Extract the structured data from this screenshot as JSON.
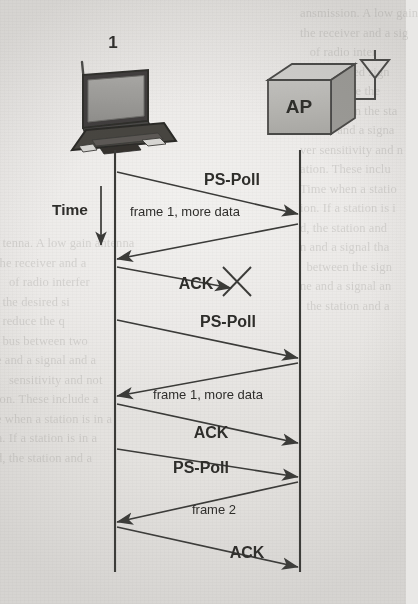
{
  "figure": {
    "background_color": "#e9e8e6",
    "ink_color": "#3a3a38",
    "fill_color": "#b9b8b5"
  },
  "nodes": {
    "station": {
      "label": "1",
      "icon": "laptop-icon",
      "timeline_x": 115,
      "timeline_top": 150,
      "timeline_bottom": 572
    },
    "access_point": {
      "label": "AP",
      "icon": "access-point-box-icon",
      "antenna_icon": "antenna-icon",
      "timeline_x": 300,
      "timeline_top": 150,
      "timeline_bottom": 572
    }
  },
  "time_axis": {
    "label": "Time",
    "arrow_icon": "arrow-down-icon",
    "x": 101,
    "y_start": 186,
    "y_end": 245
  },
  "failure_marker": {
    "icon": "cross-mark-icon",
    "meaning": "transmission lost",
    "x": 236,
    "y": 281,
    "size": 28
  },
  "chart_data": {
    "type": "sequence",
    "lifelines": [
      "1",
      "AP"
    ],
    "messages": [
      {
        "index": 1,
        "label": "PS-Poll",
        "from": "1",
        "to": "AP",
        "y_from": 172,
        "y_to": 214,
        "label_x": 232,
        "label_y": 185,
        "bold": true,
        "font_size": 16,
        "delivered": true
      },
      {
        "index": 2,
        "label": "frame 1, more data",
        "from": "AP",
        "to": "1",
        "y_from": 224,
        "y_to": 259,
        "label_x": 185,
        "label_y": 216,
        "bold": false,
        "font_size": 13,
        "delivered": true
      },
      {
        "index": 3,
        "label": "ACK",
        "from": "1",
        "to": "AP",
        "y_from": 267,
        "y_to": 300,
        "label_x": 196,
        "label_y": 289,
        "bold": true,
        "font_size": 16,
        "delivered": false
      },
      {
        "index": 4,
        "label": "PS-Poll",
        "from": "1",
        "to": "AP",
        "y_from": 320,
        "y_to": 358,
        "label_x": 228,
        "label_y": 327,
        "bold": true,
        "font_size": 16,
        "delivered": true
      },
      {
        "index": 5,
        "label": "frame 1, more data",
        "from": "AP",
        "to": "1",
        "y_from": 363,
        "y_to": 396,
        "label_x": 208,
        "label_y": 399,
        "bold": false,
        "font_size": 13,
        "delivered": true
      },
      {
        "index": 6,
        "label": "ACK",
        "from": "1",
        "to": "AP",
        "y_from": 404,
        "y_to": 443,
        "label_x": 211,
        "label_y": 438,
        "bold": true,
        "font_size": 16,
        "delivered": true
      },
      {
        "index": 7,
        "label": "PS-Poll",
        "from": "1",
        "to": "AP",
        "y_from": 449,
        "y_to": 477,
        "label_x": 201,
        "label_y": 473,
        "bold": true,
        "font_size": 16,
        "delivered": true
      },
      {
        "index": 8,
        "label": "frame 2",
        "from": "AP",
        "to": "1",
        "y_from": 482,
        "y_to": 522,
        "label_x": 214,
        "label_y": 514,
        "bold": false,
        "font_size": 13,
        "delivered": true
      },
      {
        "index": 9,
        "label": "ACK",
        "from": "1",
        "to": "AP",
        "y_from": 527,
        "y_to": 567,
        "label_x": 247,
        "label_y": 558,
        "bold": true,
        "font_size": 16,
        "delivered": true
      }
    ],
    "annotations": [
      {
        "label": "Time",
        "type": "axis-arrow",
        "direction": "down"
      },
      {
        "label": "",
        "type": "cross",
        "meaning": "lost transmission"
      }
    ]
  },
  "ghost_text": {
    "left": "  tenna. A low gain antenna\nthe receiver and a\n    of radio interfer\n  the desired si\n  reduce the q\n  bus between two\ne and a signal and a\n    sensitivity and not\nion. These include a\ne when a station is in a\nn. If a station is in a\nd, the station and a",
    "right": "ansmission. A low gain\nthe receiver and a sig\n   of radio inter\nn the desired sign\n  can reduce the\nlue between the sta\nonnect and a signa\nver sensitivity and n\nation. These inclu\nTime when a statio\nion. If a station is i\nd, the station and\nn and a signal tha\n  between the sign\nne and a signal an\n  the station and a"
  }
}
